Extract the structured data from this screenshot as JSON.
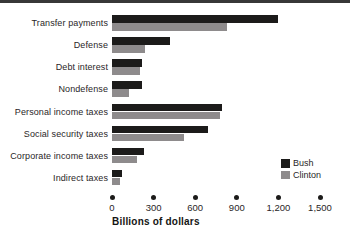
{
  "frame": {
    "background": "#ffffff",
    "top_rule_color": "#383838"
  },
  "chart_data": {
    "type": "bar",
    "orientation": "horizontal",
    "title": "",
    "xlabel": "Billions of dollars",
    "ylabel": "",
    "categories": [
      "Transfer payments",
      "Defense",
      "Debt interest",
      "Nondefense",
      "Personal income taxes",
      "Social security taxes",
      "Corporate income taxes",
      "Indirect taxes"
    ],
    "series": [
      {
        "name": "Bush",
        "color": "#1c1b1a",
        "values": [
          1200,
          420,
          215,
          215,
          790,
          690,
          230,
          70
        ]
      },
      {
        "name": "Clinton",
        "color": "#8e8b8c",
        "values": [
          830,
          240,
          200,
          120,
          780,
          520,
          180,
          60
        ]
      }
    ],
    "xlim": [
      0,
      1500
    ],
    "xticks": [
      0,
      300,
      600,
      900,
      1200,
      1500
    ],
    "xtick_labels": [
      "0",
      "300",
      "600",
      "900",
      "1,200",
      "1,500"
    ],
    "grid": false,
    "tick_marker": "dot",
    "legend_position": "right-inside"
  }
}
